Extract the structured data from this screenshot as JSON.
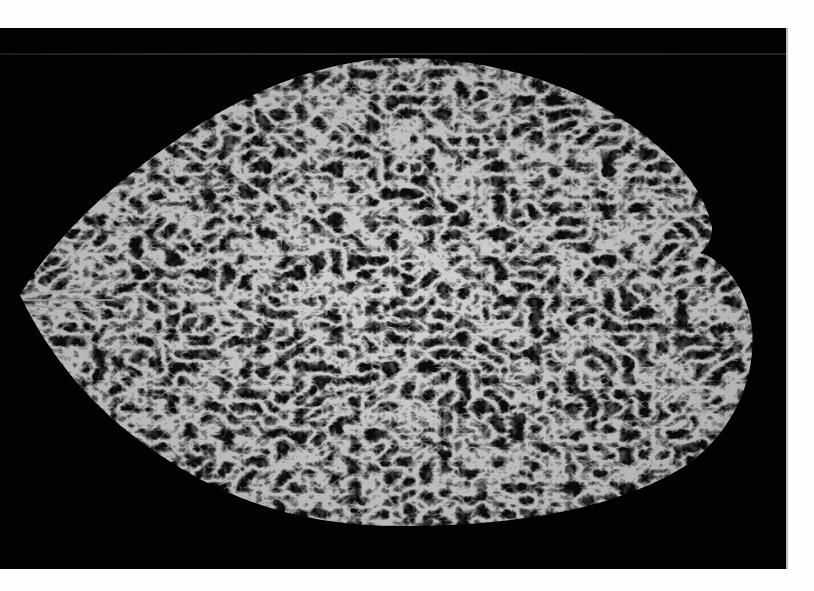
{
  "image": {
    "description": "Black-and-white photograph of a large oval, leaf-shaped object covered with a dense, ridged, spiky texture, set against a black background panel on a white page",
    "subject": "textured leaf",
    "colors": {
      "page_background": "#fdfdfd",
      "panel_background": "#020202",
      "highlight": "#d8d8d8",
      "midtone": "#7a7a7a"
    }
  }
}
